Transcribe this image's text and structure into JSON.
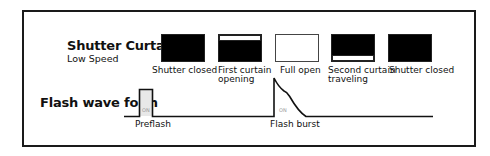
{
  "shutter_curtain": {
    "title": "Shutter Curtain",
    "subtitle": "Low Speed",
    "states": [
      {
        "label_line1": "Shutter closed",
        "label_line2": "",
        "state": "closed"
      },
      {
        "label_line1": "First curtain",
        "label_line2": "opening",
        "state": "first-curtain-opening"
      },
      {
        "label_line1": "Full open",
        "label_line2": "",
        "state": "full-open"
      },
      {
        "label_line1": "Second curtain",
        "label_line2": "traveling",
        "state": "second-curtain-traveling"
      },
      {
        "label_line1": "Shutter closed",
        "label_line2": "",
        "state": "closed"
      }
    ]
  },
  "flash_wave": {
    "title": "Flash wave form",
    "preflash_label": "Preflash",
    "preflash_on": "ON",
    "burst_label": "Flash burst",
    "burst_on": "ON"
  },
  "colors": {
    "line": "#111111",
    "closed": "#000000",
    "open": "#ffffff",
    "on_text": "#999999"
  }
}
